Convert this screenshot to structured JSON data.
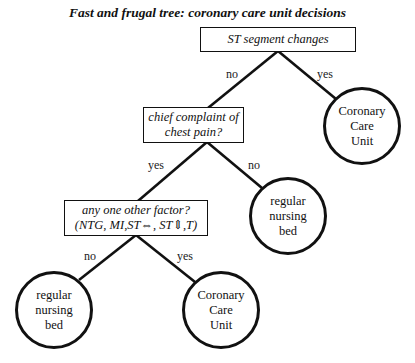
{
  "title": "Fast and frugal tree: coronary care unit decisions",
  "nodes": {
    "q1": {
      "lines": [
        "ST segment changes"
      ]
    },
    "q2": {
      "lines": [
        "chief complaint of",
        "chest pain?"
      ]
    },
    "q3": {
      "lines": [
        "any one other factor?",
        "(NTG, MI,ST⇔, ST⇕,T)"
      ]
    },
    "leaf_ccu_1": {
      "lines": [
        "Coronary",
        "Care",
        "Unit"
      ]
    },
    "leaf_bed_1": {
      "lines": [
        "regular",
        "nursing",
        "bed"
      ]
    },
    "leaf_bed_2": {
      "lines": [
        "regular",
        "nursing",
        "bed"
      ]
    },
    "leaf_ccu_2": {
      "lines": [
        "Coronary",
        "Care",
        "Unit"
      ]
    }
  },
  "edges": {
    "q1_no": "no",
    "q1_yes": "yes",
    "q2_yes": "yes",
    "q2_no": "no",
    "q3_no": "no",
    "q3_yes": "yes"
  },
  "colors": {
    "stroke": "#111111",
    "background": "#ffffff"
  }
}
